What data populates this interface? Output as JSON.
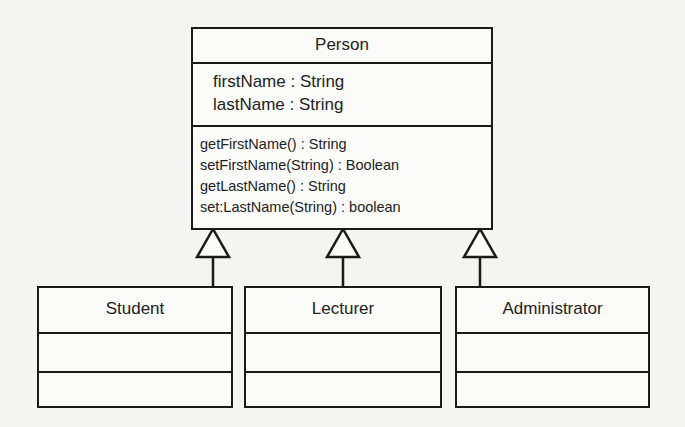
{
  "diagram": {
    "type": "UML class diagram",
    "superclass": {
      "name": "Person",
      "attributes": [
        "firstName : String",
        "lastName : String"
      ],
      "methods": [
        "getFirstName() : String",
        "setFirstName(String) : Boolean",
        "getLastName() : String",
        "set:LastName(String) : boolean"
      ]
    },
    "subclasses": [
      {
        "name": "Student",
        "attributes": [],
        "methods": []
      },
      {
        "name": "Lecturer",
        "attributes": [],
        "methods": []
      },
      {
        "name": "Administrator",
        "attributes": [],
        "methods": []
      }
    ],
    "relationships": [
      {
        "type": "generalization",
        "from": "Student",
        "to": "Person"
      },
      {
        "type": "generalization",
        "from": "Lecturer",
        "to": "Person"
      },
      {
        "type": "generalization",
        "from": "Administrator",
        "to": "Person"
      }
    ],
    "colors": {
      "line": "#1a1a1a",
      "background": "#f4f4f2"
    }
  }
}
